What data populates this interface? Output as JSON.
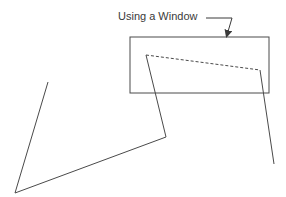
{
  "figure": {
    "label": "Using a Window",
    "colors": {
      "stroke": "#4a4a4a",
      "text": "#3a3a3a",
      "background": "#ffffff"
    },
    "window_rect": {
      "x": 130,
      "y": 37,
      "width": 139,
      "height": 56
    },
    "polyline_points": [
      [
        48,
        82
      ],
      [
        15,
        193
      ],
      [
        166,
        137
      ],
      [
        146,
        55
      ],
      [
        260,
        70
      ],
      [
        274,
        164
      ]
    ],
    "clipped_segment": {
      "from": [
        146,
        55
      ],
      "to": [
        260,
        70
      ],
      "style": "dashed"
    },
    "leader_arrow": {
      "horizontal": {
        "from": [
          206,
          18
        ],
        "to": [
          232,
          18
        ]
      },
      "pointer": {
        "from": [
          232,
          18
        ],
        "to": [
          227,
          35
        ]
      }
    }
  }
}
